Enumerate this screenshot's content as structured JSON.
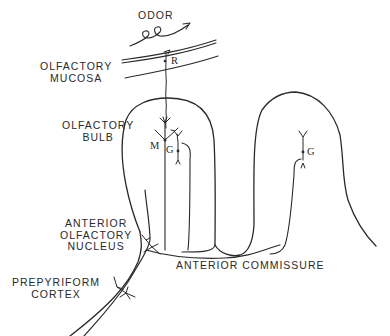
{
  "diagram": {
    "type": "anatomical-schematic",
    "labels": {
      "odor": "ODOR",
      "olfactory_mucosa": [
        "OLFACTORY",
        "MUCOSA"
      ],
      "olfactory_bulb": [
        "OLFACTORY",
        "BULB"
      ],
      "anterior_olfactory_nucleus": [
        "ANTERIOR",
        "OLFACTORY",
        "NUCLEUS"
      ],
      "prepyriform_cortex": [
        "PREPYRIFORM",
        "CORTEX"
      ],
      "anterior_commissure": "ANTERIOR COMMISSURE"
    },
    "cell_labels": {
      "receptor": "R",
      "mitral": "M",
      "granule_left": "G",
      "granule_right": "G"
    }
  }
}
